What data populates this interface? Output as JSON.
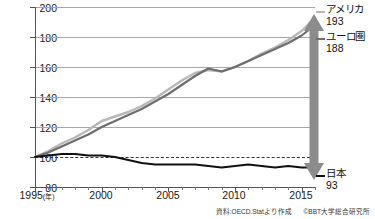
{
  "chart_data": {
    "type": "line",
    "title": "",
    "xlabel": "年",
    "ylabel": "",
    "ylim": [
      80,
      200
    ],
    "xlim": [
      1995,
      2016
    ],
    "grid": true,
    "legend_position": "right-inline",
    "y_ticks": [
      "200",
      "180",
      "160",
      "140",
      "120",
      "100",
      "80"
    ],
    "x_ticks": [
      "1995",
      "2000",
      "2005",
      "2010",
      "2015"
    ],
    "x_unit": "(年)",
    "reference_line": 100,
    "x": [
      1995,
      1996,
      1997,
      1998,
      1999,
      2000,
      2001,
      2002,
      2003,
      2004,
      2005,
      2006,
      2007,
      2008,
      2009,
      2010,
      2011,
      2012,
      2013,
      2014,
      2015,
      2016
    ],
    "series": [
      {
        "name": "アメリカ",
        "end_value": "193",
        "color": "#b8b8b8",
        "values": [
          100,
          104,
          109,
          113,
          118,
          124,
          127,
          130,
          134,
          139,
          145,
          151,
          156,
          158,
          157,
          160,
          164,
          169,
          173,
          178,
          184,
          193
        ]
      },
      {
        "name": "ユーロ圏",
        "end_value": "188",
        "color": "#6e6e6e",
        "values": [
          100,
          103,
          107,
          111,
          115,
          120,
          124,
          128,
          132,
          137,
          142,
          148,
          154,
          159,
          157,
          160,
          164,
          168,
          172,
          176,
          181,
          188
        ]
      },
      {
        "name": "日本",
        "end_value": "93",
        "color": "#111111",
        "values": [
          100,
          101,
          102,
          102,
          101,
          101,
          100,
          98,
          96,
          95,
          95,
          95,
          95,
          94,
          93,
          94,
          95,
          94,
          93,
          94,
          93,
          93
        ]
      }
    ],
    "annotation": {
      "type": "double-arrow",
      "from": 188,
      "to": 93,
      "color": "#8c8c8c"
    }
  },
  "footer": {
    "source": "資料:OECD.Statより作成",
    "copyright": "©BBT大学総合研究所"
  }
}
